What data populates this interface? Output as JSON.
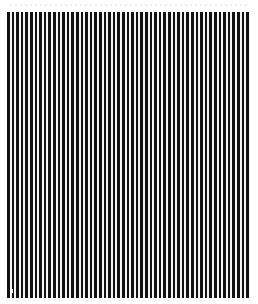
{
  "image": {
    "description": "Vertical black and white stripe pattern (grating)",
    "pattern": {
      "orientation": "vertical",
      "stripe_color": "#111111",
      "gap_color": "#f4f4f4",
      "period_px": 4.6,
      "region": {
        "left": 7,
        "top": 12,
        "width": 243,
        "height": 286
      }
    },
    "background_color": "#ffffff"
  }
}
